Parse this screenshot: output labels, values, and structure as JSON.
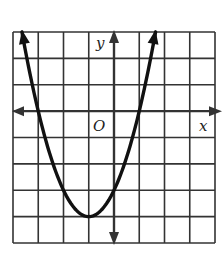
{
  "chart_data": {
    "type": "line",
    "title": "",
    "xlabel": "x",
    "ylabel": "y",
    "origin_label": "O",
    "xlim": [
      -4,
      4
    ],
    "ylim": [
      -5,
      3
    ],
    "grid": true,
    "grid_step": 1,
    "function": "y = x^2 + 2x - 3",
    "vertex": [
      -1,
      -4
    ],
    "x_intercepts": [
      -3,
      1
    ],
    "y_intercept": -3,
    "series": [
      {
        "name": "parabola",
        "x": [
          -3.65,
          -3,
          -2,
          -1,
          0,
          1,
          1.65
        ],
        "y": [
          3,
          0,
          -3,
          -4,
          -3,
          0,
          3
        ]
      }
    ]
  },
  "colors": {
    "grid": "#333333",
    "curve": "#111111",
    "background": "#ffffff"
  }
}
